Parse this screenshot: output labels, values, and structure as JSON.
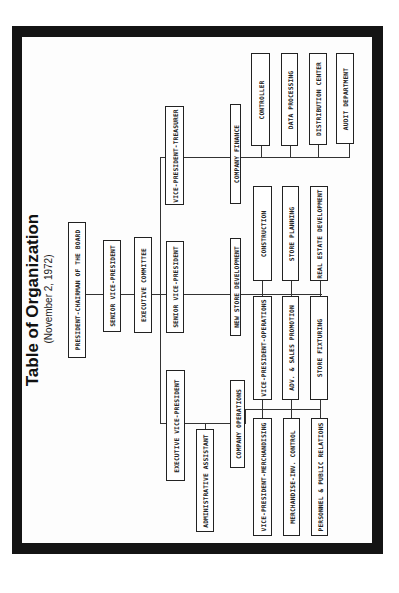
{
  "title": "Table of Organization",
  "subtitle": "(November 2, 1972)",
  "boxes": {
    "president": "PRESIDENT-CHAIRMAN OF THE BOARD",
    "senior_vp_1": "SENIOR VICE-PRESIDENT",
    "executive_committee": "EXECUTIVE COMMITTEE",
    "vp_treasurer": "VICE-PRESIDENT-TREASURER",
    "senior_vp_2": "SENIOR VICE-PRESIDENT",
    "executive_vp": "EXECUTIVE VICE-PRESIDENT",
    "administrative_assistant": "ADMINISTRATIVE ASSISTANT",
    "company_finance": "COMPANY FINANCE",
    "new_store_development": "NEW STORE DEVELOPMENT",
    "company_operations": "COMPANY OPERATIONS",
    "controller": "CONTROLLER",
    "data_processing": "DATA PROCESSING",
    "distribution_center": "DISTRIBUTION CENTER",
    "audit_department": "AUDIT DEPARTMENT",
    "construction": "CONSTRUCTION",
    "store_planning": "STORE PLANNING",
    "real_estate_development": "REAL ESTATE DEVELOPMENT",
    "vp_operations": "VICE-PRESIDENT-OPERATIONS",
    "adv_sales_promotion": "ADV. & SALES PROMOTION",
    "store_fixturing": "STORE FIXTURING",
    "vp_merchandising": "VICE-PRESIDENT-MERCHANDISING",
    "merchandise_inv_control": "MERCHANDISE-INV. CONTROL",
    "personnel_public_relations": "PERSONNEL & PUBLIC RELATIONS"
  }
}
